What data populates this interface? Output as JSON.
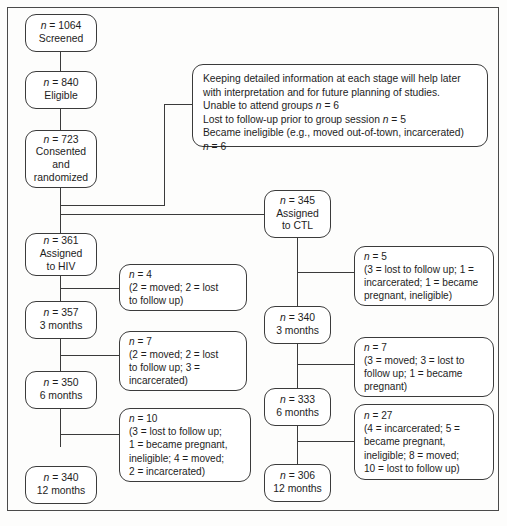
{
  "diagram": {
    "stroke_color": "#3b3b3b",
    "background_color": "#fdfdfc"
  },
  "info_box": {
    "paragraph_line1": "Keeping detailed information at each stage will help later",
    "paragraph_line2": "with interpretation and for future planning of studies.",
    "item1": "Unable to attend groups n = 6",
    "item2": "Lost to follow-up prior to group session n = 5",
    "item3": "Became ineligible (e.g., moved out-of-town, incarcerated)",
    "item4": "n = 6"
  },
  "enrollment": {
    "screened": {
      "count_line": "n = 1064",
      "label_line": "Screened"
    },
    "eligible": {
      "count_line": "n = 840",
      "label_line": "Eligible"
    },
    "consented": {
      "count_line": "n = 723",
      "label_line1": "Consented",
      "label_line2": "and",
      "label_line3": "randomized"
    }
  },
  "hiv_arm": {
    "assigned": {
      "count_line": "n = 361",
      "label_line1": "Assigned",
      "label_line2": "to HIV"
    },
    "month3": {
      "count_line": "n = 357",
      "label_line": "3 months"
    },
    "month6": {
      "count_line": "n = 350",
      "label_line": "6 months"
    },
    "month12": {
      "count_line": "n = 340",
      "label_line": "12 months"
    },
    "loss1": {
      "count_line": "n = 4",
      "line1": "(2 = moved; 2 = lost",
      "line2": "to follow up)"
    },
    "loss2": {
      "count_line": "n = 7",
      "line1": "(2 = moved; 2 = lost",
      "line2": "to follow up; 3 =",
      "line3": "incarcerated)"
    },
    "loss3": {
      "count_line": "n = 10",
      "line1": "(3 = lost to follow up;",
      "line2": "1 = became pregnant,",
      "line3": "ineligible; 4 = moved;",
      "line4": "2 = incarcerated)"
    }
  },
  "ctl_arm": {
    "assigned": {
      "count_line": "n = 345",
      "label_line1": "Assigned",
      "label_line2": "to CTL"
    },
    "month3": {
      "count_line": "n = 340",
      "label_line": "3 months"
    },
    "month6": {
      "count_line": "n = 333",
      "label_line": "6 months"
    },
    "month12": {
      "count_line": "n = 306",
      "label_line": "12 months"
    },
    "loss1": {
      "count_line": "n = 5",
      "line1": "(3 = lost to follow up; 1 =",
      "line2": "incarcerated; 1 = became",
      "line3": "pregnant, ineligible)"
    },
    "loss2": {
      "count_line": "n = 7",
      "line1": "(3 = moved; 3 = lost to",
      "line2": "follow up; 1 = became",
      "line3": "pregnant)"
    },
    "loss3": {
      "count_line": "n = 27",
      "line1": "(4 = incarcerated; 5 =",
      "line2": "became pregnant,",
      "line3": "ineligible; 8 = moved;",
      "line4": "10 = lost to follow up)"
    }
  }
}
